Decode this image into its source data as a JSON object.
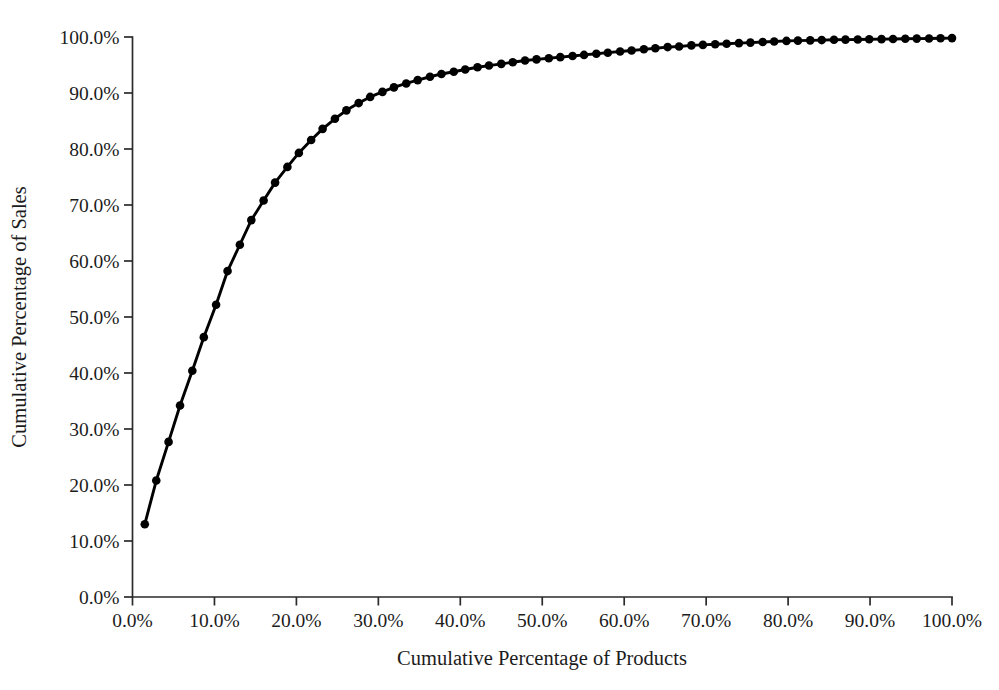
{
  "chart_data": {
    "type": "line",
    "title": "",
    "xlabel": "Cumulative Percentage of Products",
    "ylabel": "Cumulative Percentage of Sales",
    "xlim": [
      0,
      100
    ],
    "ylim": [
      0,
      100
    ],
    "grid": false,
    "legend": false,
    "marker": "filled-circle",
    "line_color": "#000000",
    "marker_color": "#000000",
    "background_color": "#ffffff",
    "xticks": [
      0,
      10,
      20,
      30,
      40,
      50,
      60,
      70,
      80,
      90,
      100
    ],
    "yticks": [
      0,
      10,
      20,
      30,
      40,
      50,
      60,
      70,
      80,
      90,
      100
    ],
    "xtick_labels": [
      "0.0%",
      "10.0%",
      "20.0%",
      "30.0%",
      "40.0%",
      "50.0%",
      "60.0%",
      "70.0%",
      "80.0%",
      "90.0%",
      "100.0%"
    ],
    "ytick_labels": [
      "0.0%",
      "10.0%",
      "20.0%",
      "30.0%",
      "40.0%",
      "50.0%",
      "60.0%",
      "70.0%",
      "80.0%",
      "90.0%",
      "100.0%"
    ],
    "x": [
      1.5,
      2.9,
      4.4,
      5.8,
      7.3,
      8.7,
      10.2,
      11.6,
      13.1,
      14.5,
      16.0,
      17.4,
      18.9,
      20.3,
      21.8,
      23.2,
      24.7,
      26.1,
      27.6,
      29.0,
      30.5,
      31.9,
      33.4,
      34.8,
      36.3,
      37.7,
      39.2,
      40.6,
      42.1,
      43.5,
      45.0,
      46.4,
      47.9,
      49.3,
      50.8,
      52.2,
      53.7,
      55.1,
      56.6,
      58.0,
      59.5,
      60.9,
      62.4,
      63.8,
      65.3,
      66.7,
      68.2,
      69.6,
      71.1,
      72.5,
      74.0,
      75.4,
      76.9,
      78.3,
      79.8,
      81.2,
      82.7,
      84.1,
      85.6,
      87.0,
      88.5,
      89.9,
      91.4,
      92.8,
      94.3,
      95.7,
      97.2,
      98.6,
      100.0
    ],
    "y": [
      13.0,
      20.8,
      27.7,
      34.2,
      40.4,
      46.4,
      52.2,
      58.2,
      62.9,
      67.3,
      70.8,
      74.0,
      76.8,
      79.3,
      81.6,
      83.6,
      85.4,
      86.9,
      88.2,
      89.3,
      90.2,
      91.0,
      91.7,
      92.3,
      92.9,
      93.4,
      93.8,
      94.2,
      94.6,
      94.9,
      95.2,
      95.5,
      95.8,
      96.0,
      96.2,
      96.4,
      96.6,
      96.8,
      97.0,
      97.2,
      97.4,
      97.6,
      97.8,
      98.0,
      98.2,
      98.3,
      98.5,
      98.6,
      98.7,
      98.8,
      98.9,
      99.0,
      99.1,
      99.2,
      99.3,
      99.35,
      99.4,
      99.45,
      99.5,
      99.53,
      99.56,
      99.59,
      99.62,
      99.65,
      99.68,
      99.71,
      99.74,
      99.77,
      99.8
    ],
    "series": [
      {
        "name": "Cumulative sales",
        "marker_count": 69
      }
    ]
  },
  "axes": {
    "y_title": "Cumulative Percentage of Sales",
    "x_title": "Cumulative Percentage of Products"
  }
}
